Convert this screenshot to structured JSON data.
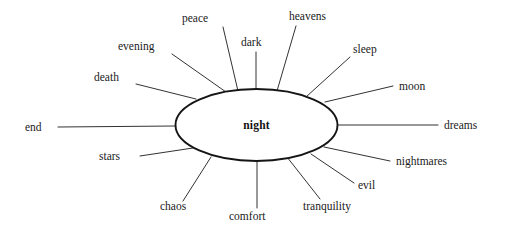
{
  "diagram": {
    "type": "word-association-web",
    "title_word": "night",
    "background_color": "#ffffff",
    "ink_color": "#1a1a1a",
    "center": {
      "label": "night",
      "cx": 256.5,
      "cy": 125,
      "rx": 81,
      "ry": 36,
      "bold": true
    },
    "nodes": [
      {
        "label": "peace",
        "text_x": 182,
        "text_y": 22,
        "anchor": "start",
        "line": {
          "x1": 223,
          "y1": 27,
          "x2": 238,
          "y2": 91
        }
      },
      {
        "label": "dark",
        "text_x": 241,
        "text_y": 46,
        "anchor": "start",
        "line": {
          "x1": 256,
          "y1": 52,
          "x2": 256,
          "y2": 89
        }
      },
      {
        "label": "heavens",
        "text_x": 289,
        "text_y": 20,
        "anchor": "start",
        "line": {
          "x1": 296,
          "y1": 26,
          "x2": 277,
          "y2": 91
        }
      },
      {
        "label": "sleep",
        "text_x": 353,
        "text_y": 53,
        "anchor": "start",
        "line": {
          "x1": 350,
          "y1": 57,
          "x2": 306,
          "y2": 97
        }
      },
      {
        "label": "evening",
        "text_x": 118,
        "text_y": 50,
        "anchor": "start",
        "line": {
          "x1": 172,
          "y1": 54,
          "x2": 226,
          "y2": 92
        }
      },
      {
        "label": "death",
        "text_x": 94,
        "text_y": 81,
        "anchor": "start",
        "line": {
          "x1": 136,
          "y1": 84,
          "x2": 196,
          "y2": 99
        }
      },
      {
        "label": "moon",
        "text_x": 399,
        "text_y": 90,
        "anchor": "start",
        "line": {
          "x1": 393,
          "y1": 86,
          "x2": 325,
          "y2": 102
        }
      },
      {
        "label": "end",
        "text_x": 25,
        "text_y": 131,
        "anchor": "start",
        "line": {
          "x1": 58,
          "y1": 127,
          "x2": 176,
          "y2": 126
        }
      },
      {
        "label": "dreams",
        "text_x": 444,
        "text_y": 129,
        "anchor": "start",
        "line": {
          "x1": 337,
          "y1": 125,
          "x2": 438,
          "y2": 125
        }
      },
      {
        "label": "stars",
        "text_x": 99,
        "text_y": 160,
        "anchor": "start",
        "line": {
          "x1": 140,
          "y1": 156,
          "x2": 193,
          "y2": 148
        }
      },
      {
        "label": "nightmares",
        "text_x": 396,
        "text_y": 165,
        "anchor": "start",
        "line": {
          "x1": 390,
          "y1": 161,
          "x2": 324,
          "y2": 147
        }
      },
      {
        "label": "evil",
        "text_x": 358,
        "text_y": 189,
        "anchor": "start",
        "line": {
          "x1": 354,
          "y1": 183,
          "x2": 311,
          "y2": 154
        }
      },
      {
        "label": "chaos",
        "text_x": 160,
        "text_y": 210,
        "anchor": "start",
        "line": {
          "x1": 183,
          "y1": 201,
          "x2": 211,
          "y2": 157
        }
      },
      {
        "label": "comfort",
        "text_x": 229,
        "text_y": 220,
        "anchor": "start",
        "line": {
          "x1": 257,
          "y1": 208,
          "x2": 257,
          "y2": 161
        }
      },
      {
        "label": "tranquility",
        "text_x": 303,
        "text_y": 210,
        "anchor": "start",
        "line": {
          "x1": 320,
          "y1": 199,
          "x2": 287,
          "y2": 157
        }
      }
    ]
  }
}
